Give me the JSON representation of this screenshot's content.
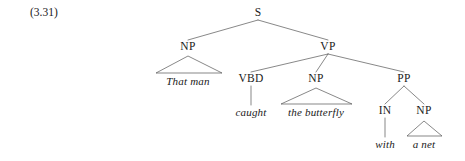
{
  "figure": {
    "example_number": "(3.31)",
    "background_color": "#ffffff",
    "line_color": "#555555",
    "text_color": "#1a1a1a"
  },
  "nodes": {
    "s": {
      "label": "S",
      "x": 258,
      "y": 13
    },
    "np_subject": {
      "label": "NP",
      "x": 188,
      "y": 47
    },
    "vp": {
      "label": "VP",
      "x": 328,
      "y": 47
    },
    "that_man": {
      "label": "That man",
      "x": 188,
      "y": 81
    },
    "vbd": {
      "label": "VBD",
      "x": 251,
      "y": 79
    },
    "np_object": {
      "label": "NP",
      "x": 316,
      "y": 79
    },
    "pp": {
      "label": "PP",
      "x": 404,
      "y": 79
    },
    "caught": {
      "label": "caught",
      "x": 251,
      "y": 112
    },
    "the_butterfly": {
      "label": "the butterfly",
      "x": 316,
      "y": 112
    },
    "in": {
      "label": "IN",
      "x": 385,
      "y": 111
    },
    "np_object_pp": {
      "label": "NP",
      "x": 424,
      "y": 111
    },
    "with": {
      "label": "with",
      "x": 385,
      "y": 144
    },
    "a_net": {
      "label": "a net",
      "x": 424,
      "y": 144
    }
  },
  "edges": [
    {
      "from": "s",
      "to": "np_subject",
      "type": "line"
    },
    {
      "from": "s",
      "to": "vp",
      "type": "line"
    },
    {
      "from": "vp",
      "to": "vbd",
      "type": "line"
    },
    {
      "from": "vp",
      "to": "np_object",
      "type": "line"
    },
    {
      "from": "vp",
      "to": "pp",
      "type": "line"
    },
    {
      "from": "vbd",
      "to": "caught",
      "type": "stem"
    },
    {
      "from": "pp",
      "to": "in",
      "type": "line"
    },
    {
      "from": "pp",
      "to": "np_object_pp",
      "type": "line"
    },
    {
      "from": "in",
      "to": "with",
      "type": "stem"
    }
  ],
  "triangles": [
    {
      "parent": "np_subject",
      "child": "that_man",
      "apex_x": 188,
      "apex_y": 56,
      "left_x": 156,
      "right_x": 222,
      "base_y": 73
    },
    {
      "parent": "np_object",
      "child": "the_butterfly",
      "apex_x": 316,
      "apex_y": 88,
      "left_x": 281,
      "right_x": 352,
      "base_y": 104
    },
    {
      "parent": "np_object_pp",
      "child": "a_net",
      "apex_x": 424,
      "apex_y": 121,
      "left_x": 407,
      "right_x": 442,
      "base_y": 136
    }
  ],
  "sentence": "That man caught the butterfly with a net"
}
